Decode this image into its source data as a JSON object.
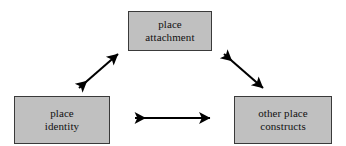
{
  "diagram": {
    "type": "triangular-relationship",
    "background_color": "#ffffff",
    "node_fill_color": "#c0c0c0",
    "node_border_color": "#3a3a3a",
    "arrow_color": "#000000",
    "nodes": [
      {
        "id": "place-attachment",
        "line1": "place",
        "line2": "attachment",
        "position": "top-center"
      },
      {
        "id": "place-identity",
        "line1": "place",
        "line2": "identity",
        "position": "bottom-left"
      },
      {
        "id": "other-place-constructs",
        "line1": "other place",
        "line2": "constructs",
        "position": "bottom-right"
      }
    ],
    "connectors": [
      {
        "id": "identity-to-attachment",
        "from": "place-identity",
        "to": "place-attachment",
        "style": "double-headed-arrow",
        "orientation": "diagonal-up-right"
      },
      {
        "id": "attachment-to-other-constructs",
        "from": "place-attachment",
        "to": "other-place-constructs",
        "style": "double-headed-arrow",
        "orientation": "diagonal-down-right"
      },
      {
        "id": "identity-to-other-constructs",
        "from": "place-identity",
        "to": "other-place-constructs",
        "style": "double-headed-arrow",
        "orientation": "horizontal"
      }
    ]
  }
}
